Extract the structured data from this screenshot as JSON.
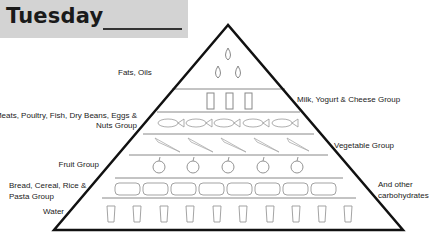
{
  "header": {
    "title": "Tuesday"
  },
  "pyramid": {
    "tiers": [
      {
        "name": "fats-oils",
        "label": "Fats, Oils",
        "icon": "oil-drop-icon",
        "count": 3
      },
      {
        "name": "milk",
        "label": "Milk, Yogurt & Cheese Group",
        "icon": "milk-carton-icon",
        "count": 3
      },
      {
        "name": "meats",
        "label_line1": "Meats, Poultry, Fish, Dry Beans, Eggs &",
        "label_line2": "Nuts Group",
        "icon": "fish-icon",
        "count": 5
      },
      {
        "name": "vegetable",
        "label": "Vegetable Group",
        "icon": "carrot-icon",
        "count": 5
      },
      {
        "name": "fruit",
        "label": "Fruit Group",
        "icon": "apple-icon",
        "count": 5
      },
      {
        "name": "bread",
        "label_line1": "Bread, Cereal, Rice &",
        "label_line2": "Pasta Group",
        "icon": "bread-loaf-icon",
        "count": 8
      },
      {
        "name": "water",
        "label": "Water",
        "icon": "water-glass-icon",
        "count": 10
      }
    ],
    "side_note_line1": "And other",
    "side_note_line2": "carbohydrates"
  }
}
